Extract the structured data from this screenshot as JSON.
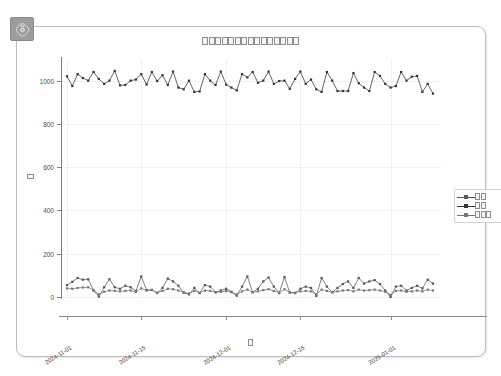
{
  "app": {
    "badge_icon": "openai-logo-icon",
    "badge_color": "#9d9d9d"
  },
  "card": {
    "border_color": "#b9bec4",
    "background": "#ffffff"
  },
  "chart_data": {
    "type": "line",
    "title": "□□□□□□□□□□□□□□□",
    "title_tofu_count": 15,
    "xlabel": "□",
    "xlabel_tofu_count": 1,
    "ylabel": "□",
    "ylabel_tofu_count": 1,
    "grid": true,
    "legend_position": "right",
    "ylim": [
      0,
      1100
    ],
    "yticks": [
      0,
      200,
      400,
      600,
      800,
      1000
    ],
    "ytick_labels": [
      "0",
      "200",
      "400",
      "600",
      "800",
      "1000"
    ],
    "xticks": [
      "2024-11-01",
      "2024-11-15",
      "2024-12-01",
      "2024-12-15",
      "2025-01-01"
    ],
    "xtick_positions": [
      0,
      14,
      30,
      44,
      61
    ],
    "x_range": [
      "2024-10-30",
      "2025-01-07"
    ],
    "n_points": 70,
    "legend": [
      {
        "name": "□□",
        "tofu_count": 2,
        "marker": "dot",
        "color": "#555555"
      },
      {
        "name": "□□",
        "tofu_count": 2,
        "marker": "dot",
        "color": "#333333"
      },
      {
        "name": "□□□",
        "tofu_count": 3,
        "marker": "dot",
        "color": "#777777"
      }
    ],
    "series": [
      {
        "name": "series-top",
        "color": "#333333",
        "values": [
          1020,
          975,
          1030,
          1012,
          1000,
          1040,
          1008,
          985,
          1000,
          1045,
          978,
          980,
          1000,
          1005,
          1030,
          982,
          1040,
          998,
          1025,
          980,
          1042,
          968,
          960,
          1000,
          948,
          950,
          1030,
          1000,
          980,
          1042,
          982,
          968,
          955,
          1030,
          1015,
          1040,
          990,
          1000,
          1042,
          985,
          998,
          1000,
          962,
          1008,
          1042,
          985,
          1005,
          960,
          948,
          1040,
          1000,
          952,
          952,
          952,
          1035,
          988,
          968,
          952,
          1040,
          1022,
          985,
          968,
          975,
          1040,
          1000,
          1018,
          1022,
          948,
          985,
          940
        ]
      },
      {
        "name": "series-mid",
        "color": "#555555",
        "values": [
          55,
          70,
          88,
          80,
          82,
          30,
          2,
          45,
          82,
          45,
          38,
          52,
          45,
          28,
          95,
          32,
          33,
          18,
          42,
          85,
          72,
          52,
          20,
          12,
          42,
          18,
          55,
          48,
          22,
          30,
          38,
          24,
          6,
          48,
          95,
          22,
          38,
          72,
          90,
          48,
          18,
          92,
          20,
          18,
          38,
          48,
          42,
          5,
          88,
          48,
          22,
          42,
          60,
          72,
          42,
          88,
          62,
          72,
          78,
          60,
          30,
          0,
          48,
          52,
          30,
          42,
          52,
          40,
          80,
          62,
          0,
          30,
          68,
          82
        ]
      },
      {
        "name": "series-low",
        "color": "#777777",
        "values": [
          40,
          38,
          42,
          44,
          45,
          32,
          12,
          24,
          30,
          28,
          26,
          28,
          30,
          24,
          40,
          30,
          32,
          20,
          28,
          38,
          36,
          30,
          22,
          16,
          28,
          20,
          30,
          28,
          22,
          24,
          28,
          22,
          12,
          26,
          34,
          22,
          26,
          32,
          36,
          28,
          20,
          36,
          22,
          20,
          26,
          28,
          26,
          12,
          34,
          28,
          22,
          26,
          30,
          32,
          26,
          34,
          30,
          32,
          34,
          30,
          24,
          10,
          28,
          30,
          24,
          26,
          30,
          26,
          34,
          30,
          10,
          24,
          30,
          34
        ]
      }
    ]
  }
}
